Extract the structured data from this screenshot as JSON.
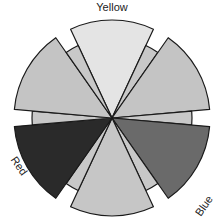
{
  "diagram": {
    "type": "color-wheel",
    "center": [
      112,
      118
    ],
    "labels": {
      "yellow": "Yellow",
      "red": "Red",
      "blue": "Blue"
    },
    "sectors": [
      {
        "name": "Yellow",
        "start": -25,
        "end": 25,
        "radius": 98,
        "fill": "#e4e4e4"
      },
      {
        "name": "tertiary-1",
        "start": 25,
        "end": 35,
        "radius": 80,
        "fill": "#c8c8c8"
      },
      {
        "name": "secondary-right",
        "start": 35,
        "end": 85,
        "radius": 98,
        "fill": "#c4c4c4"
      },
      {
        "name": "tertiary-2",
        "start": 85,
        "end": 95,
        "radius": 80,
        "fill": "#c8c8c8"
      },
      {
        "name": "Blue",
        "start": 95,
        "end": 145,
        "radius": 98,
        "fill": "#6a6a6a"
      },
      {
        "name": "tertiary-3",
        "start": 145,
        "end": 155,
        "radius": 80,
        "fill": "#c8c8c8"
      },
      {
        "name": "secondary-bottom",
        "start": 155,
        "end": 205,
        "radius": 98,
        "fill": "#c6c6c6"
      },
      {
        "name": "tertiary-4",
        "start": 205,
        "end": 215,
        "radius": 80,
        "fill": "#c8c8c8"
      },
      {
        "name": "Red",
        "start": 215,
        "end": 265,
        "radius": 98,
        "fill": "#2a2a2a"
      },
      {
        "name": "tertiary-5",
        "start": 265,
        "end": 275,
        "radius": 80,
        "fill": "#c8c8c8"
      },
      {
        "name": "secondary-left",
        "start": 275,
        "end": 325,
        "radius": 98,
        "fill": "#c4c4c4"
      },
      {
        "name": "tertiary-6",
        "start": 325,
        "end": 335,
        "radius": 80,
        "fill": "#c8c8c8"
      }
    ]
  }
}
